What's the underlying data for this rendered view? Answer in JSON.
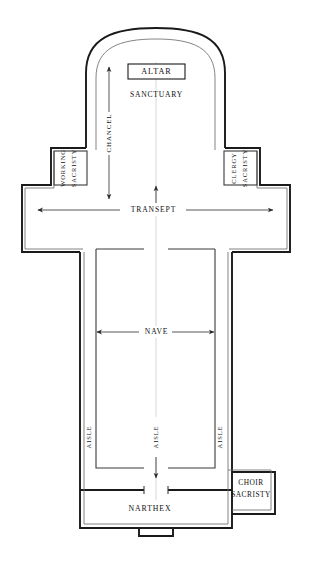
{
  "diagram": {
    "type": "architectural-floor-plan",
    "orientation": "altar at top (liturgical east), narthex at bottom (west)",
    "background_color": "#ffffff",
    "line_color": "#1a1a1a",
    "text_color": "#111111"
  },
  "spaces": {
    "altar": {
      "label": "ALTAR",
      "style": "boxed-label",
      "region": "apse, upper center"
    },
    "sanctuary": {
      "label": "SANCTUARY",
      "style": "plain-label",
      "region": "apse interior below altar"
    },
    "chancel": {
      "label": "CHANCEL",
      "style": "vertical-dimension-label",
      "orientation": "vertical",
      "region": "left of sanctuary axis, double-headed arrow"
    },
    "working_sacristy": {
      "label_line_1": "WORKING",
      "label_line_2": "SACRISTY",
      "label": "WORKING SACRISTY",
      "orientation": "vertical",
      "region": "left of chancel, upper-left wing"
    },
    "clergy_sacristy": {
      "label_line_1": "CLERGY",
      "label_line_2": "SACRISTY",
      "label": "CLERGY SACRISTY",
      "orientation": "vertical",
      "region": "right of chancel, upper-right wing"
    },
    "transept": {
      "label": "TRANSEPT",
      "style": "horizontal-dimension-label",
      "orientation": "horizontal",
      "region": "crossing arms, left to right"
    },
    "nave": {
      "label": "NAVE",
      "style": "horizontal-dimension-label",
      "orientation": "horizontal",
      "region": "central vessel below crossing"
    },
    "aisle_left": {
      "label": "AISLE",
      "orientation": "vertical",
      "region": "left side aisle"
    },
    "aisle_center": {
      "label": "AISLE",
      "orientation": "vertical",
      "region": "central aisle on main axis"
    },
    "aisle_right": {
      "label": "AISLE",
      "orientation": "vertical",
      "region": "right side aisle"
    },
    "narthex": {
      "label": "NARTHEX",
      "style": "plain-label",
      "region": "entrance vestibule, bottom"
    },
    "choir_sacristy": {
      "label_line_1": "CHOIR",
      "label_line_2": "SACRISTY",
      "label": "CHOIR SACRISTY",
      "region": "bottom right, adjoining narthex"
    }
  },
  "annotations": {
    "arrows": [
      {
        "name": "chancel-arrow",
        "direction": "vertical-double",
        "label": "CHANCEL"
      },
      {
        "name": "transept-arrow",
        "direction": "horizontal-double",
        "label": "TRANSEPT"
      },
      {
        "name": "nave-arrow",
        "direction": "horizontal-double",
        "label": "NAVE"
      },
      {
        "name": "center-axis-arrow",
        "direction": "vertical-double",
        "label": "AISLE"
      }
    ],
    "center_axis": "vertical centerline through sanctuary, crossing, nave and narthex"
  }
}
